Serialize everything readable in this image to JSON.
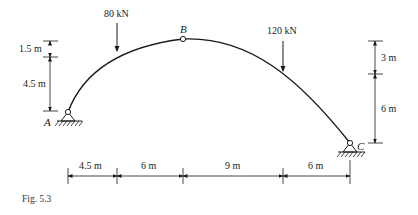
{
  "figure": {
    "caption": "Fig. 5.3",
    "type": "three-hinged parabolic arch"
  },
  "points": {
    "A": {
      "label": "A",
      "type": "pin-support"
    },
    "B": {
      "label": "B",
      "type": "crown-hinge"
    },
    "C": {
      "label": "C",
      "type": "pin-support"
    }
  },
  "loads": [
    {
      "label": "80 kN",
      "direction": "down",
      "distance_from_A_m": 4.5
    },
    {
      "label": "120 kN",
      "direction": "down",
      "distance_from_A_m": 19.5
    }
  ],
  "dimensions": {
    "horizontal": [
      {
        "label": "4.5 m"
      },
      {
        "label": "6 m"
      },
      {
        "label": "9 m"
      },
      {
        "label": "6 m"
      }
    ],
    "left_vertical": [
      {
        "label": "1.5 m"
      },
      {
        "label": "4.5 m"
      }
    ],
    "right_vertical": [
      {
        "label": "3 m"
      },
      {
        "label": "6 m"
      }
    ]
  },
  "colors": {
    "line": "#1a1a1a",
    "background": "#ffffff"
  }
}
